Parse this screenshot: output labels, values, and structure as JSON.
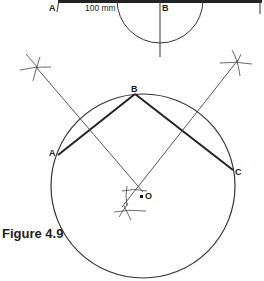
{
  "figure": {
    "caption": "Figure 4.9",
    "top_construction": {
      "label_a": "A",
      "label_b": "B",
      "measurement": "100 mm"
    },
    "main_construction": {
      "label_a": "A",
      "label_b": "B",
      "label_c": "C",
      "label_o": "O"
    },
    "colors": {
      "line": "#333333",
      "thick_line": "#222222",
      "background": "#ffffff"
    }
  }
}
